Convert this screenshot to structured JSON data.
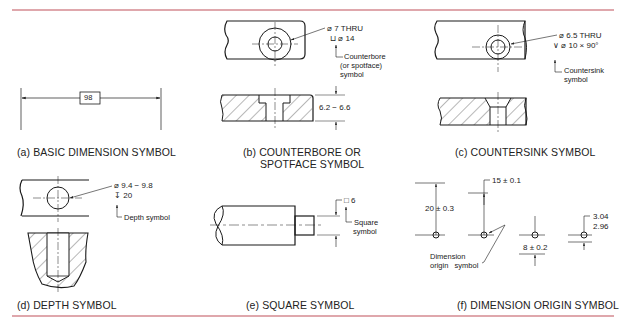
{
  "figure": {
    "rule_color": "#c0505a",
    "panels": [
      {
        "id": "a",
        "caption": "(a) BASIC DIMENSION SYMBOL",
        "dimensions": [
          "98"
        ]
      },
      {
        "id": "b",
        "caption_line1": "(b) COUNTERBORE OR",
        "caption_line2": "SPOTFACE SYMBOL",
        "callout_line1": "⌀ 7 THRU",
        "callout_line2": "⊔ ⌀ 14",
        "note_line1": "Counterbore",
        "note_line2": "(or spotface)",
        "note_line3": "symbol",
        "dimensions": [
          "6.2 − 6.6"
        ]
      },
      {
        "id": "c",
        "caption": "(c) COUNTERSINK SYMBOL",
        "callout_line1": "⌀ 6.5 THRU",
        "callout_line2": "∨ ⌀ 10 × 90°",
        "note_line1": "Countersink",
        "note_line2": "symbol"
      },
      {
        "id": "d",
        "caption": "(d) DEPTH SYMBOL",
        "callout_line1": "⌀ 9.4 − 9.8",
        "callout_line2": "↧ 20",
        "note_line1": "Depth symbol"
      },
      {
        "id": "e",
        "caption": "(e) SQUARE SYMBOL",
        "callout_line1": "□ 6",
        "note_line1": "Square",
        "note_line2": "symbol"
      },
      {
        "id": "f",
        "caption": "(f) DIMENSION ORIGIN SYMBOL",
        "dimensions": [
          "20 ± 0.3",
          "15 ± 0.1",
          "8 ± 0.2",
          "3.04",
          "2.96"
        ],
        "note_line1": "Dimension",
        "note_line2": "origin   symbol"
      }
    ]
  }
}
